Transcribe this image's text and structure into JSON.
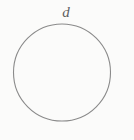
{
  "figure": {
    "name": "circle-with-diameter-label",
    "background_color": "#fbfbfa",
    "stroke_color": "#8a8a8a",
    "label_color": "#5f5f5f",
    "stroke_width": 1.1,
    "circle": {
      "center_x": 62,
      "center_y": 72.5,
      "radius": 48.5
    },
    "labels": {
      "diameter": "d"
    },
    "label_position": {
      "x": 66,
      "y": 17
    }
  }
}
